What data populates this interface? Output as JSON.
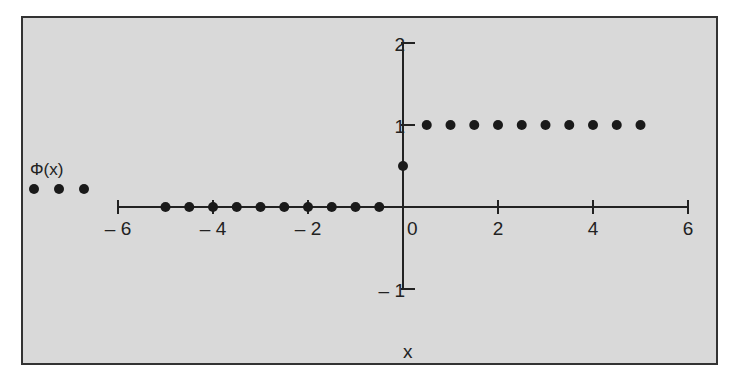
{
  "chart_data": {
    "type": "scatter",
    "title": "",
    "xlabel": "x",
    "ylabel": "",
    "legend": {
      "entries": [
        "Φ(x)"
      ],
      "position": "left"
    },
    "xlim": [
      -6,
      6
    ],
    "ylim": [
      -1,
      2
    ],
    "x_ticks": [
      -6,
      -4,
      -2,
      0,
      2,
      4,
      6
    ],
    "x_tick_labels": [
      "– 6",
      "– 4",
      "– 2",
      "0",
      "2",
      "4",
      "6"
    ],
    "y_ticks": [
      -1,
      1,
      2
    ],
    "y_tick_labels": [
      "– 1",
      "1",
      "2"
    ],
    "grid": false,
    "series": [
      {
        "name": "Φ(x)",
        "x": [
          -5,
          -4.5,
          -4,
          -3.5,
          -3,
          -2.5,
          -2,
          -1.5,
          -1,
          -0.5,
          0,
          0.5,
          1,
          1.5,
          2,
          2.5,
          3,
          3.5,
          4,
          4.5,
          5
        ],
        "y": [
          0,
          0,
          0,
          0,
          0,
          0,
          0,
          0,
          0,
          0,
          0.5,
          1,
          1,
          1,
          1,
          1,
          1,
          1,
          1,
          1,
          1
        ]
      }
    ]
  },
  "colors": {
    "background": "#d9d9d9",
    "frame": "#333333",
    "marker": "#1a1a1a",
    "axis": "#222222"
  }
}
